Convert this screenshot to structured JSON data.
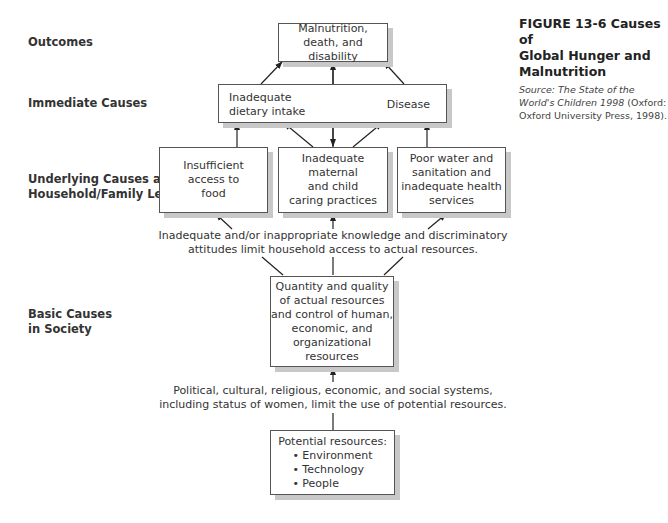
{
  "levels": {
    "outcomes": "Outcomes",
    "immediate": "Immediate Causes",
    "underlying": [
      "Underlying Causes at",
      "Household/Family Level"
    ],
    "basic": [
      "Basic Causes",
      "in Society"
    ]
  },
  "boxes": {
    "outcome": [
      "Malnutrition,",
      "death, and disability"
    ],
    "immediate_left": [
      "Inadequate",
      "dietary intake"
    ],
    "immediate_right": "Disease",
    "underlying_food": [
      "Insufficient",
      "access to",
      "food"
    ],
    "underlying_care": [
      "Inadequate maternal",
      "and child",
      "caring practices"
    ],
    "underlying_water": [
      "Poor water and",
      "sanitation and",
      "inadequate health",
      "services"
    ],
    "basic": [
      "Quantity and quality",
      "of actual resources",
      "and control of human,",
      "economic, and",
      "organizational",
      "resources"
    ],
    "potential_title": "Potential resources:",
    "potential_items": [
      "• Environment",
      "• Technology",
      "• People"
    ]
  },
  "captions": {
    "knowledge": [
      "Inadequate and/or inappropriate knowledge and discriminatory",
      "attitudes limit household access to actual resources."
    ],
    "systems": [
      "Political, cultural, religious, economic, and social systems,",
      "including status of women, limit the use of potential resources."
    ]
  },
  "figure": {
    "title": [
      "FIGURE 13-6  Causes of",
      "Global Hunger and",
      "Malnutrition"
    ],
    "source_italic": "Source: The State of the World's Children 1998",
    "source_rest": " (Oxford: Oxford University Press, 1998)."
  }
}
